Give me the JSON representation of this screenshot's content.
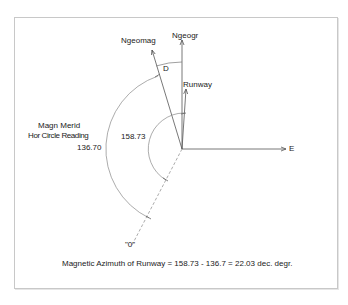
{
  "diagram": {
    "labels": {
      "ngeomag": "Ngeomag",
      "ngeogr": "Ngeogr",
      "declination": "D",
      "runway": "Runway",
      "east": "E",
      "magn_merid_line1": "Magn Merid",
      "magn_merid_line2": "Hor Circle Reading",
      "reading_magn_merid": "136.70",
      "reading_runway": "158.73",
      "zero_mark": "\"0\""
    },
    "formula": "Magnetic Azimuth of Runway = 158.73 - 136.7 = 22.03 dec. degr.",
    "values": {
      "hor_circle_reading_magn_merid": 136.7,
      "hor_circle_reading_runway": 158.73,
      "magnetic_azimuth_runway": 22.03,
      "units": "dec. degr."
    },
    "colors": {
      "lines": "#555555",
      "arcs": "#777777",
      "text": "#222222",
      "frame": "#c8c8c8"
    }
  }
}
